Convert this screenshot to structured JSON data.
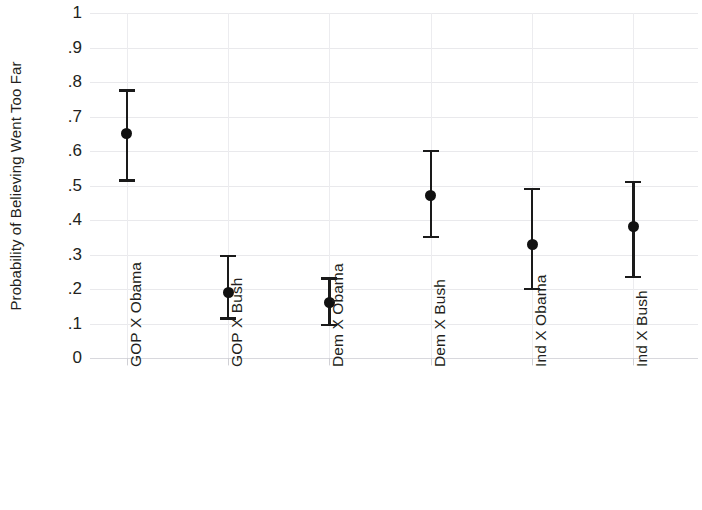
{
  "chart_data": {
    "type": "scatter",
    "title": "",
    "subtitle": "",
    "xlabel": "",
    "ylabel": "Probability of Believing Went Too Far",
    "ylim": [
      0,
      1
    ],
    "ytick_labels": [
      "1",
      ".9",
      ".8",
      ".7",
      ".6",
      ".5",
      ".4",
      ".3",
      ".2",
      ".1",
      "0"
    ],
    "ytick_values": [
      1,
      0.9,
      0.8,
      0.7,
      0.6,
      0.5,
      0.4,
      0.3,
      0.2,
      0.1,
      0
    ],
    "grid": true,
    "legend": "none",
    "categories": [
      "GOP X Obama",
      "GOP X Bush",
      "Dem X Obama",
      "Dem X Bush",
      "Ind X Obama",
      "Ind X Bush"
    ],
    "values": [
      0.65,
      0.19,
      0.16,
      0.47,
      0.33,
      0.38
    ],
    "ci_lower": [
      0.515,
      0.115,
      0.095,
      0.35,
      0.2,
      0.235
    ],
    "ci_upper": [
      0.775,
      0.295,
      0.23,
      0.6,
      0.49,
      0.51
    ],
    "marker": "filled-circle",
    "marker_color": "#111111",
    "errorbar_color": "#1a1a1a",
    "grid_color": "#e9e9ec",
    "background_color": "#ffffff"
  }
}
